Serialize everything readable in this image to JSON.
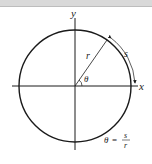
{
  "diagram": {
    "axis_x_label": "x",
    "axis_y_label": "y",
    "radius_label": "r",
    "arc_label": "s",
    "angle_label": "θ",
    "formula": {
      "lhs": "θ",
      "eq": "=",
      "numerator": "s",
      "denominator": "r"
    },
    "colors": {
      "stroke": "#1a1a1a",
      "topbar": "#d9d9d9"
    }
  }
}
